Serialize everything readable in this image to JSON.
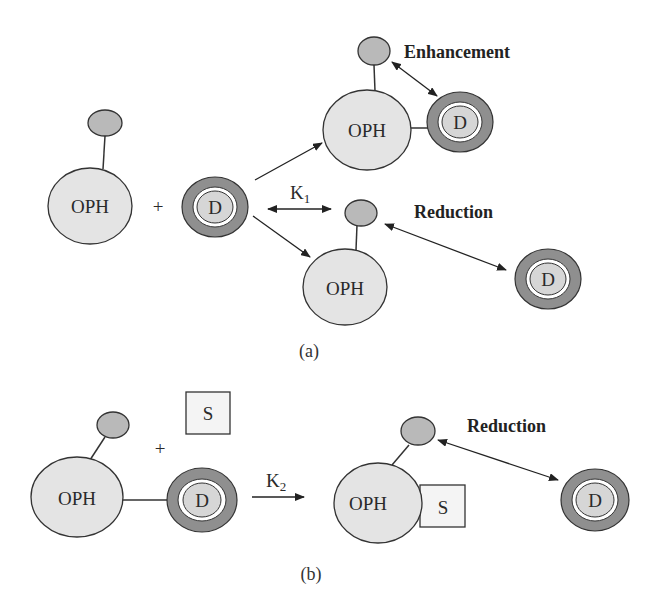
{
  "panel_a": {
    "caption": "(a)",
    "oph_label": "OPH",
    "d_label": "D",
    "plus": "+",
    "rate_constant": "K",
    "rate_constant_sub": "1",
    "enhancement_label": "Enhancement",
    "reduction_label": "Reduction"
  },
  "panel_b": {
    "caption": "(b)",
    "oph_label": "OPH",
    "d_label": "D",
    "s_label": "S",
    "plus": "+",
    "rate_constant": "K",
    "rate_constant_sub": "2",
    "reduction_label": "Reduction"
  },
  "colors": {
    "oph_fill": "#e4e4e4",
    "small_fill": "#b9b9b9",
    "d_outer_ring": "#8f8f8f",
    "d_inner_fill": "#d6d6d6",
    "stroke": "#333333"
  }
}
